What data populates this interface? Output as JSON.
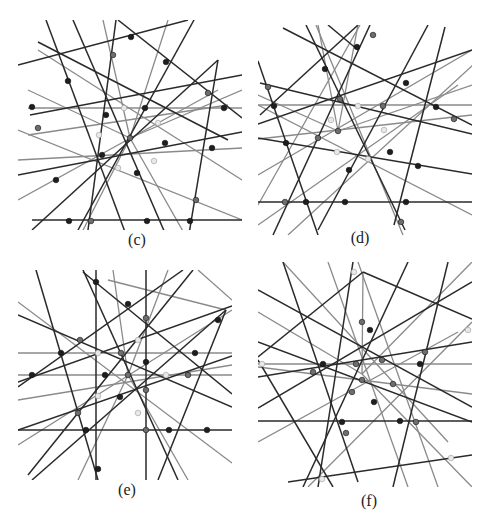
{
  "figure": {
    "colors": {
      "dark_line": "#2a2a2a",
      "gray_line": "#8a8a8a",
      "dark_node": "#1e1e1e",
      "gray_node": "#6e6e6e",
      "light_node": "#e8e8e8",
      "background": "#ffffff"
    },
    "panels": [
      {
        "id": "c",
        "label": "(c)",
        "box": [
          0,
          0,
          224,
          210
        ],
        "center": [
          112,
          118
        ],
        "lines": [
          [
            14,
            200,
            224,
            200,
            "d"
          ],
          [
            10,
            88,
            224,
            88,
            "g"
          ],
          [
            28,
            0,
            110,
            220,
            "d"
          ],
          [
            100,
            0,
            224,
            98,
            "d"
          ],
          [
            98,
            0,
            70,
            210,
            "d"
          ],
          [
            20,
            22,
            210,
            120,
            "d"
          ],
          [
            200,
            40,
            170,
            220,
            "d"
          ],
          [
            0,
            155,
            224,
            112,
            "d"
          ],
          [
            12,
            95,
            224,
            55,
            "d"
          ],
          [
            10,
            115,
            210,
            85,
            "g"
          ],
          [
            0,
            45,
            170,
            0,
            "d"
          ],
          [
            55,
            0,
            150,
            220,
            "d"
          ],
          [
            176,
            0,
            60,
            210,
            "d"
          ],
          [
            14,
            210,
            200,
            40,
            "d"
          ],
          [
            0,
            110,
            224,
            200,
            "g"
          ],
          [
            0,
            180,
            200,
            70,
            "g"
          ],
          [
            20,
            30,
            224,
            160,
            "g"
          ],
          [
            0,
            140,
            224,
            128,
            "g"
          ],
          [
            85,
            0,
            112,
            118,
            "g"
          ],
          [
            150,
            0,
            112,
            118,
            "g"
          ],
          [
            10,
            70,
            112,
            118,
            "g"
          ],
          [
            224,
            70,
            112,
            118,
            "g"
          ],
          [
            60,
            220,
            112,
            118,
            "g"
          ],
          [
            170,
            220,
            112,
            118,
            "g"
          ]
        ],
        "nodes": [
          [
            113,
            17,
            "d"
          ],
          [
            95,
            35,
            "g"
          ],
          [
            148,
            42,
            "d"
          ],
          [
            50,
            61,
            "d"
          ],
          [
            190,
            73,
            "g"
          ],
          [
            14,
            87,
            "d"
          ],
          [
            206,
            88,
            "d"
          ],
          [
            106,
            88,
            "l"
          ],
          [
            127,
            88,
            "d"
          ],
          [
            88,
            95,
            "d"
          ],
          [
            140,
            103,
            "l"
          ],
          [
            20,
            108,
            "g"
          ],
          [
            81,
            115,
            "l"
          ],
          [
            112,
            118,
            "g"
          ],
          [
            147,
            123,
            "d"
          ],
          [
            194,
            128,
            "d"
          ],
          [
            84,
            135,
            "d"
          ],
          [
            136,
            141,
            "l"
          ],
          [
            100,
            148,
            "l"
          ],
          [
            119,
            153,
            "d"
          ],
          [
            38,
            160,
            "d"
          ],
          [
            178,
            180,
            "g"
          ],
          [
            51,
            201,
            "d"
          ],
          [
            73,
            201,
            "g"
          ],
          [
            129,
            201,
            "d"
          ],
          [
            172,
            201,
            "d"
          ]
        ]
      },
      {
        "id": "d",
        "label": "(d)",
        "box": [
          0,
          0,
          214,
          210
        ],
        "center": [
          80,
          106
        ],
        "lines": [
          [
            0,
            177,
            214,
            177,
            "d"
          ],
          [
            0,
            80,
            214,
            80,
            "g"
          ],
          [
            25,
            3,
            214,
            100,
            "d"
          ],
          [
            70,
            0,
            100,
            25,
            "d"
          ],
          [
            0,
            36,
            60,
            210,
            "d"
          ],
          [
            2,
            90,
            100,
            0,
            "d"
          ],
          [
            187,
            2,
            136,
            200,
            "d"
          ],
          [
            0,
            99,
            214,
            25,
            "d"
          ],
          [
            2,
            58,
            214,
            109,
            "d"
          ],
          [
            0,
            114,
            214,
            90,
            "g"
          ],
          [
            15,
            210,
            112,
            0,
            "d"
          ],
          [
            102,
            0,
            0,
            180,
            "g"
          ],
          [
            48,
            0,
            147,
            205,
            "d"
          ],
          [
            170,
            0,
            60,
            205,
            "d"
          ],
          [
            0,
            113,
            214,
            149,
            "d"
          ],
          [
            0,
            80,
            214,
            190,
            "g"
          ],
          [
            0,
            150,
            214,
            25,
            "g"
          ],
          [
            0,
            200,
            200,
            60,
            "g"
          ],
          [
            215,
            40,
            30,
            210,
            "g"
          ],
          [
            58,
            0,
            145,
            210,
            "g"
          ],
          [
            60,
            0,
            80,
            106,
            "g"
          ],
          [
            0,
            70,
            80,
            106,
            "g"
          ],
          [
            100,
            0,
            80,
            106,
            "g"
          ],
          [
            214,
            60,
            80,
            106,
            "g"
          ]
        ],
        "nodes": [
          [
            115,
            10,
            "g"
          ],
          [
            99,
            22,
            "d"
          ],
          [
            67,
            44,
            "d"
          ],
          [
            148,
            58,
            "d"
          ],
          [
            10,
            62,
            "g"
          ],
          [
            82,
            74,
            "g"
          ],
          [
            16,
            81,
            "d"
          ],
          [
            100,
            81,
            "l"
          ],
          [
            125,
            81,
            "g"
          ],
          [
            178,
            82,
            "d"
          ],
          [
            196,
            94,
            "g"
          ],
          [
            73,
            95,
            "l"
          ],
          [
            126,
            105,
            "l"
          ],
          [
            80,
            106,
            "g"
          ],
          [
            60,
            113,
            "g"
          ],
          [
            28,
            118,
            "d"
          ],
          [
            79,
            127,
            "l"
          ],
          [
            132,
            127,
            "d"
          ],
          [
            110,
            134,
            "l"
          ],
          [
            91,
            145,
            "d"
          ],
          [
            160,
            141,
            "d"
          ],
          [
            27,
            177,
            "g"
          ],
          [
            48,
            177,
            "d"
          ],
          [
            87,
            177,
            "d"
          ],
          [
            148,
            177,
            "d"
          ],
          [
            143,
            197,
            "g"
          ]
        ]
      },
      {
        "id": "e",
        "label": "(e)",
        "box": [
          0,
          0,
          214,
          210
        ],
        "center": [
          110,
          105
        ],
        "lines": [
          [
            0,
            160,
            214,
            160,
            "d"
          ],
          [
            0,
            83,
            214,
            83,
            "g"
          ],
          [
            0,
            105,
            214,
            105,
            "g"
          ],
          [
            78,
            0,
            78,
            210,
            "d"
          ],
          [
            128,
            0,
            128,
            210,
            "d"
          ],
          [
            18,
            0,
            80,
            210,
            "d"
          ],
          [
            65,
            2,
            214,
            124,
            "d"
          ],
          [
            0,
            45,
            214,
            137,
            "d"
          ],
          [
            0,
            117,
            165,
            0,
            "d"
          ],
          [
            0,
            112,
            214,
            36,
            "d"
          ],
          [
            0,
            160,
            214,
            86,
            "d"
          ],
          [
            14,
            210,
            208,
            40,
            "d"
          ],
          [
            208,
            40,
            140,
            210,
            "d"
          ],
          [
            208,
            40,
            90,
            10,
            "g"
          ],
          [
            0,
            175,
            214,
            40,
            "g"
          ],
          [
            0,
            32,
            214,
            193,
            "g"
          ],
          [
            10,
            205,
            175,
            0,
            "d"
          ],
          [
            65,
            0,
            160,
            210,
            "d"
          ],
          [
            95,
            0,
            110,
            105,
            "g"
          ],
          [
            150,
            0,
            110,
            105,
            "g"
          ],
          [
            60,
            210,
            110,
            105,
            "g"
          ],
          [
            170,
            210,
            110,
            105,
            "g"
          ],
          [
            0,
            130,
            214,
            95,
            "g"
          ],
          [
            180,
            0,
            214,
            30,
            "g"
          ]
        ],
        "nodes": [
          [
            78,
            12,
            "d"
          ],
          [
            110,
            34,
            "d"
          ],
          [
            128,
            48,
            "g"
          ],
          [
            200,
            50,
            "d"
          ],
          [
            62,
            70,
            "g"
          ],
          [
            43,
            83,
            "d"
          ],
          [
            80,
            83,
            "l"
          ],
          [
            103,
            83,
            "g"
          ],
          [
            120,
            70,
            "l"
          ],
          [
            177,
            83,
            "d"
          ],
          [
            128,
            92,
            "d"
          ],
          [
            14,
            105,
            "d"
          ],
          [
            87,
            105,
            "d"
          ],
          [
            110,
            105,
            "g"
          ],
          [
            148,
            105,
            "l"
          ],
          [
            170,
            105,
            "g"
          ],
          [
            128,
            120,
            "g"
          ],
          [
            80,
            126,
            "l"
          ],
          [
            102,
            127,
            "d"
          ],
          [
            120,
            143,
            "l"
          ],
          [
            60,
            143,
            "g"
          ],
          [
            68,
            160,
            "d"
          ],
          [
            128,
            160,
            "g"
          ],
          [
            151,
            160,
            "d"
          ],
          [
            189,
            160,
            "d"
          ],
          [
            80,
            199,
            "d"
          ]
        ]
      },
      {
        "id": "f",
        "label": "(f)",
        "box": [
          0,
          0,
          214,
          225
        ],
        "center": [
          104,
          112
        ],
        "lines": [
          [
            0,
            102,
            214,
            102,
            "g"
          ],
          [
            0,
            159,
            214,
            159,
            "d"
          ],
          [
            30,
            220,
            214,
            193,
            "d"
          ],
          [
            25,
            0,
            100,
            220,
            "d"
          ],
          [
            105,
            10,
            214,
            57,
            "d"
          ],
          [
            0,
            95,
            105,
            10,
            "d"
          ],
          [
            0,
            80,
            214,
            160,
            "d"
          ],
          [
            0,
            28,
            214,
            145,
            "d"
          ],
          [
            150,
            0,
            45,
            225,
            "d"
          ],
          [
            0,
            146,
            214,
            20,
            "d"
          ],
          [
            0,
            115,
            214,
            80,
            "d"
          ],
          [
            190,
            0,
            135,
            225,
            "d"
          ],
          [
            0,
            98,
            75,
            225,
            "d"
          ],
          [
            95,
            0,
            60,
            225,
            "d"
          ],
          [
            70,
            0,
            150,
            225,
            "g"
          ],
          [
            100,
            0,
            180,
            225,
            "g"
          ],
          [
            0,
            180,
            200,
            70,
            "g"
          ],
          [
            214,
            60,
            50,
            225,
            "g"
          ],
          [
            0,
            105,
            214,
            132,
            "g"
          ],
          [
            190,
            180,
            25,
            0,
            "g"
          ],
          [
            105,
            10,
            104,
            112,
            "g"
          ],
          [
            0,
            50,
            104,
            112,
            "g"
          ],
          [
            104,
            112,
            214,
            225,
            "g"
          ],
          [
            104,
            112,
            214,
            0,
            "g"
          ]
        ],
        "nodes": [
          [
            96,
            10,
            "l"
          ],
          [
            104,
            60,
            "g"
          ],
          [
            112,
            68,
            "d"
          ],
          [
            210,
            68,
            "l"
          ],
          [
            4,
            102,
            "l"
          ],
          [
            65,
            102,
            "d"
          ],
          [
            98,
            102,
            "g"
          ],
          [
            124,
            98,
            "g"
          ],
          [
            167,
            90,
            "g"
          ],
          [
            162,
            102,
            "d"
          ],
          [
            55,
            110,
            "g"
          ],
          [
            104,
            118,
            "g"
          ],
          [
            135,
            122,
            "g"
          ],
          [
            94,
            130,
            "g"
          ],
          [
            116,
            140,
            "d"
          ],
          [
            84,
            160,
            "d"
          ],
          [
            142,
            159,
            "d"
          ],
          [
            158,
            160,
            "g"
          ],
          [
            88,
            171,
            "g"
          ],
          [
            193,
            196,
            "l"
          ],
          [
            64,
            217,
            "l"
          ]
        ]
      }
    ]
  }
}
